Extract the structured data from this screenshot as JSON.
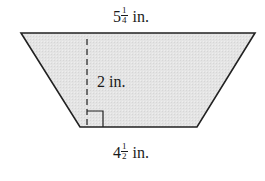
{
  "figure": {
    "shape": "trapezoid",
    "fill_color": "#e3e3e3",
    "stroke_color": "#222222",
    "top_base": {
      "whole": "5",
      "numerator": "1",
      "denominator": "4",
      "unit": "in."
    },
    "bottom_base": {
      "whole": "4",
      "numerator": "1",
      "denominator": "2",
      "unit": "in."
    },
    "height": {
      "label": "2 in."
    },
    "right_angle_marker": true
  }
}
